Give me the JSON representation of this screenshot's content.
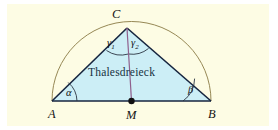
{
  "figure": {
    "name": "thales-triangle-figure",
    "caption_text": "Thalesdreieck",
    "background_color": "#fdfce4",
    "page_color": "#ffffff"
  },
  "geometry": {
    "triangle": {
      "fill_color": "#cceef6",
      "stroke_color": "#16253f",
      "points": "52,101 127,28 211,101"
    },
    "semicircle": {
      "stroke_color": "#8a7b45",
      "center_x": 131.5,
      "center_y": 101,
      "radius": 79.5,
      "path": "M 52,101 A 79.5,79.5 0 0 1 211,101"
    },
    "baseline": {
      "stroke_color": "#16253f",
      "x1": 52,
      "y1": 101,
      "x2": 211,
      "y2": 101
    },
    "median": {
      "stroke_color": "#8f5f8c",
      "x1": 127,
      "y1": 28,
      "x2": 131.5,
      "y2": 101
    },
    "center_dot": {
      "fill_color": "#101010",
      "cx": 131.5,
      "cy": 101,
      "r": 3.2
    }
  },
  "labels": {
    "vertex_a": "A",
    "vertex_b": "B",
    "vertex_c": "C",
    "midpoint_m": "M",
    "angle_alpha": "α",
    "angle_beta": "β",
    "angle_gamma1": "γ",
    "angle_gamma1_sub": "1",
    "angle_gamma2": "γ",
    "angle_gamma2_sub": "2",
    "interior_text": "Thalesdreieck"
  },
  "angle_arcs": {
    "stroke_color": "#2a3442",
    "alpha_path": "M 77,101 A 25,25 0 0 0 68.2,82.5",
    "beta_path": "M 183,101 A 28,28 0 0 0 194.6,78.6",
    "gamma1_path": "M 106.5,50.5 A 26,26 0 0 0 128.4,54",
    "gamma2_path": "M 128.4,54 A 26,26 0 0 0 148.5,48.5"
  }
}
